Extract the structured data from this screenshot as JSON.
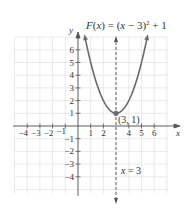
{
  "figure": {
    "title_parts": {
      "lhs": "F(x) = (x − 3)",
      "exp": "2",
      "rhs": " + 1"
    },
    "x_axis_label": "x",
    "y_axis_label": "y",
    "vertex_label": "(3, 1)",
    "axis_of_symmetry_label": "x = 3",
    "x_ticks": [
      "−4",
      "−3",
      "−2",
      "−1",
      "1",
      "2",
      "4",
      "5",
      "6"
    ],
    "y_ticks": [
      "6",
      "5",
      "4",
      "3",
      "2",
      "1",
      "−1",
      "−2",
      "−3",
      "−4"
    ],
    "colors": {
      "curve": "#6b6b6b",
      "axes": "#555555",
      "grid": "#dcdcdc",
      "dashed": "#555555"
    }
  },
  "chart_data": {
    "type": "line",
    "xlabel": "x",
    "ylabel": "y",
    "xlim": [
      -5,
      7
    ],
    "ylim": [
      -5,
      7
    ],
    "grid": true,
    "series": [
      {
        "name": "F(x) = (x − 3)^2 + 1",
        "x": [
          0.5,
          1,
          1.5,
          2,
          2.5,
          3,
          3.5,
          4,
          4.5,
          5,
          5.5
        ],
        "y": [
          7.25,
          5,
          3.25,
          2,
          1.25,
          1,
          1.25,
          2,
          3.25,
          5,
          7.25
        ]
      }
    ],
    "annotations": [
      {
        "text": "(3, 1)",
        "x": 3,
        "y": 1,
        "type": "vertex point"
      },
      {
        "text": "x = 3",
        "type": "dashed vertical axis of symmetry",
        "x": 3
      }
    ]
  }
}
